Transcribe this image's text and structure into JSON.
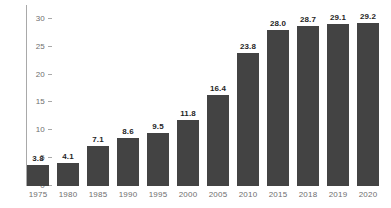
{
  "chart_data": {
    "type": "bar",
    "title": "",
    "xlabel": "",
    "ylabel": "",
    "categories": [
      "1975",
      "1980",
      "1985",
      "1990",
      "1995",
      "2000",
      "2005",
      "2010",
      "2015",
      "2018",
      "2019",
      "2020"
    ],
    "values": [
      3.8,
      4.1,
      7.1,
      8.6,
      9.5,
      11.8,
      16.4,
      23.8,
      28.0,
      28.7,
      29.1,
      29.2
    ],
    "value_labels": [
      "3.8",
      "4.1",
      "7.1",
      "8.6",
      "9.5",
      "11.8",
      "16.4",
      "23.8",
      "28.0",
      "28.7",
      "29.1",
      "29.2"
    ],
    "ylim": [
      0,
      32.5
    ],
    "yticks": [
      0,
      5,
      10,
      15,
      20,
      25,
      30
    ],
    "ytick_labels": [
      "0",
      "5",
      "10",
      "15",
      "20",
      "25",
      "30"
    ],
    "grid": false,
    "legend": false,
    "legend_position": "none",
    "bar_color": "#434343",
    "axis_color": "#a9a9a9",
    "tick_label_color": "#6e6e6e",
    "value_label_color": "#1f1f1f",
    "background_color": "#ffffff"
  }
}
